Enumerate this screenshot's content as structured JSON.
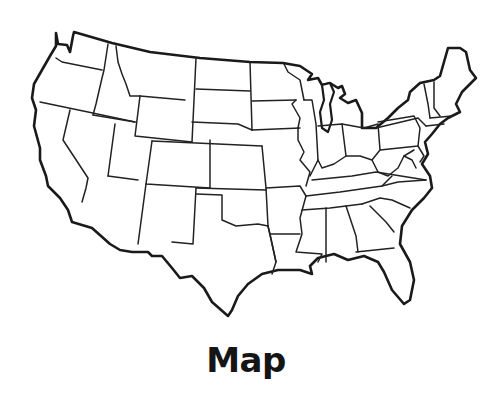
{
  "caption": "Map",
  "map": {
    "subject": "United States (contiguous 48 states) outline",
    "style": "black state borders on white background",
    "stroke_color": "#1a1a1a",
    "background_color": "#ffffff"
  }
}
